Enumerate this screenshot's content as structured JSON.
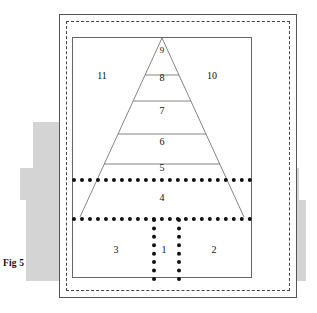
{
  "figure": {
    "caption": "Fig 5",
    "title": "",
    "frames": {
      "outer_label": "outer solid frame",
      "middle_label": "dashed frame",
      "inner_label": "inner solid frame"
    },
    "colors": {
      "line": "#555555",
      "inner_line": "#666666",
      "dotted": "#111111",
      "gray_block": "#d4d4d4",
      "background": "#ffffff"
    },
    "pyramid": {
      "bands": [
        {
          "id": "band-9",
          "label": "9"
        },
        {
          "id": "band-8",
          "label": "8"
        },
        {
          "id": "band-7",
          "label": "7"
        },
        {
          "id": "band-6",
          "label": "6"
        },
        {
          "id": "band-5",
          "label": "5"
        },
        {
          "id": "band-4",
          "label": "4"
        }
      ],
      "side_labels": [
        {
          "id": "label-11",
          "label": "11",
          "side": "left"
        },
        {
          "id": "label-10",
          "label": "10",
          "side": "right"
        }
      ]
    },
    "base_cells": [
      {
        "id": "cell-3",
        "label": "3"
      },
      {
        "id": "cell-1",
        "label": "1"
      },
      {
        "id": "cell-2",
        "label": "2"
      }
    ],
    "gray_blocks": {
      "left": [
        "left-upper-step",
        "left-lower-step"
      ],
      "right": [
        "right-upper-step",
        "right-mid-step",
        "right-lower-step"
      ]
    }
  }
}
